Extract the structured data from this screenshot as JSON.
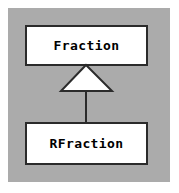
{
  "diagram": {
    "type": "uml-class-diagram",
    "background_color": "#ffffff",
    "panel_color": "#ababab",
    "line_color": "#2b2b2b",
    "box_fill_color": "#ffffff",
    "classes": [
      {
        "id": "fraction",
        "name": "Fraction",
        "role": "superclass"
      },
      {
        "id": "rfraction",
        "name": "RFraction",
        "role": "subclass"
      }
    ],
    "relationships": [
      {
        "kind": "generalization",
        "label": "",
        "from": "RFraction",
        "to": "Fraction",
        "arrowhead": "hollow-triangle"
      }
    ]
  }
}
